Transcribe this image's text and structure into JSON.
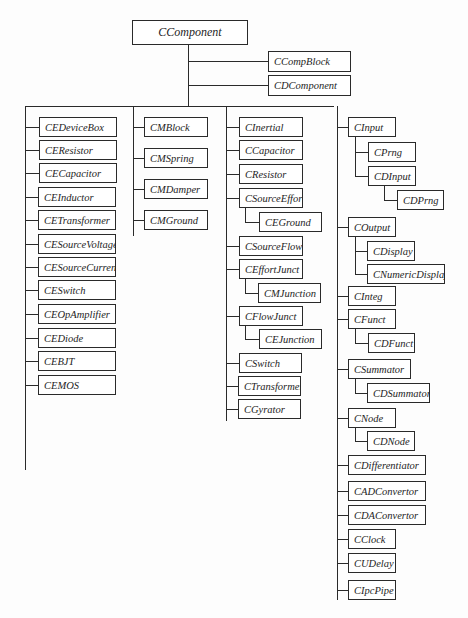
{
  "diagram": {
    "root": {
      "label": "CComponent",
      "x": 132,
      "y": 20,
      "w": 116,
      "h": 25
    },
    "boxes": [
      {
        "id": "ccompblock",
        "label": "CCompBlock",
        "x": 268,
        "y": 51,
        "w": 83,
        "h": 21
      },
      {
        "id": "cdcomponent",
        "label": "CDComponent",
        "x": 268,
        "y": 75,
        "w": 83,
        "h": 21
      },
      {
        "id": "cedevicebox",
        "label": "CEDeviceBox",
        "x": 39,
        "y": 117,
        "w": 78,
        "h": 20
      },
      {
        "id": "ceresistor",
        "label": "CEResistor",
        "x": 39,
        "y": 140,
        "w": 78,
        "h": 20
      },
      {
        "id": "cecapacitor",
        "label": "CECapacitor",
        "x": 39,
        "y": 163,
        "w": 78,
        "h": 20
      },
      {
        "id": "ceinductor",
        "label": "CEInductor",
        "x": 38,
        "y": 187,
        "w": 78,
        "h": 20
      },
      {
        "id": "cetransformer",
        "label": "CETransformer",
        "x": 38,
        "y": 210,
        "w": 78,
        "h": 20
      },
      {
        "id": "cesourcevoltage",
        "label": "CESourceVoltage",
        "x": 38,
        "y": 234,
        "w": 78,
        "h": 20
      },
      {
        "id": "cesourcecurrent",
        "label": "CESourceCurrent",
        "x": 38,
        "y": 257,
        "w": 78,
        "h": 20
      },
      {
        "id": "ceswitch",
        "label": "CESwitch",
        "x": 38,
        "y": 280,
        "w": 78,
        "h": 20
      },
      {
        "id": "ceopamplifier",
        "label": "CEOpAmplifier",
        "x": 38,
        "y": 304,
        "w": 78,
        "h": 20
      },
      {
        "id": "cediode",
        "label": "CEDiode",
        "x": 38,
        "y": 328,
        "w": 78,
        "h": 20
      },
      {
        "id": "cebjt",
        "label": "CEBJT",
        "x": 38,
        "y": 351,
        "w": 78,
        "h": 20
      },
      {
        "id": "cemos",
        "label": "CEMOS",
        "x": 38,
        "y": 375,
        "w": 78,
        "h": 20
      },
      {
        "id": "cmblock",
        "label": "CMBlock",
        "x": 144,
        "y": 117,
        "w": 64,
        "h": 20
      },
      {
        "id": "cmspring",
        "label": "CMSpring",
        "x": 144,
        "y": 148,
        "w": 64,
        "h": 20
      },
      {
        "id": "cmdamper",
        "label": "CMDamper",
        "x": 144,
        "y": 179,
        "w": 64,
        "h": 20
      },
      {
        "id": "cmground",
        "label": "CMGround",
        "x": 144,
        "y": 210,
        "w": 64,
        "h": 20
      },
      {
        "id": "cinertial",
        "label": "CInertial",
        "x": 239,
        "y": 117,
        "w": 64,
        "h": 20
      },
      {
        "id": "ccapacitor",
        "label": "CCapacitor",
        "x": 239,
        "y": 140,
        "w": 64,
        "h": 20
      },
      {
        "id": "cresistor",
        "label": "CResistor",
        "x": 239,
        "y": 164,
        "w": 64,
        "h": 20
      },
      {
        "id": "csourceeffort",
        "label": "CSourceEffort",
        "x": 239,
        "y": 188,
        "w": 64,
        "h": 20
      },
      {
        "id": "ceground",
        "label": "CEGround",
        "x": 259,
        "y": 212,
        "w": 63,
        "h": 20
      },
      {
        "id": "csourceflow",
        "label": "CSourceFlow",
        "x": 239,
        "y": 236,
        "w": 64,
        "h": 20
      },
      {
        "id": "ceffortjunct",
        "label": "CEffortJunct",
        "x": 239,
        "y": 259,
        "w": 64,
        "h": 20
      },
      {
        "id": "cmjunction",
        "label": "CMJunction",
        "x": 258,
        "y": 283,
        "w": 63,
        "h": 20
      },
      {
        "id": "cflowjunct",
        "label": "CFlowJunct",
        "x": 239,
        "y": 306,
        "w": 64,
        "h": 20
      },
      {
        "id": "cejunction",
        "label": "CEJunction",
        "x": 259,
        "y": 329,
        "w": 63,
        "h": 20
      },
      {
        "id": "cswitch",
        "label": "CSwitch",
        "x": 239,
        "y": 353,
        "w": 63,
        "h": 20
      },
      {
        "id": "ctransformer",
        "label": "CTransformer",
        "x": 238,
        "y": 376,
        "w": 63,
        "h": 20
      },
      {
        "id": "cgyrator",
        "label": "CGyrator",
        "x": 238,
        "y": 399,
        "w": 63,
        "h": 20
      },
      {
        "id": "cinput",
        "label": "CInput",
        "x": 348,
        "y": 117,
        "w": 48,
        "h": 20
      },
      {
        "id": "cprng",
        "label": "CPrng",
        "x": 368,
        "y": 142,
        "w": 48,
        "h": 20
      },
      {
        "id": "cdinput",
        "label": "CDInput",
        "x": 368,
        "y": 166,
        "w": 48,
        "h": 20
      },
      {
        "id": "cdprng",
        "label": "CDPrng",
        "x": 397,
        "y": 190,
        "w": 47,
        "h": 20
      },
      {
        "id": "coutput",
        "label": "COutput",
        "x": 348,
        "y": 217,
        "w": 48,
        "h": 20
      },
      {
        "id": "cdisplay",
        "label": "CDisplay",
        "x": 367,
        "y": 241,
        "w": 48,
        "h": 20
      },
      {
        "id": "cnumericdisplay",
        "label": "CNumericDisplay",
        "x": 367,
        "y": 264,
        "w": 78,
        "h": 20
      },
      {
        "id": "cinteg",
        "label": "CInteg",
        "x": 348,
        "y": 286,
        "w": 48,
        "h": 20
      },
      {
        "id": "cfunct",
        "label": "CFunct",
        "x": 348,
        "y": 309,
        "w": 48,
        "h": 20
      },
      {
        "id": "cdfunct",
        "label": "CDFunct",
        "x": 368,
        "y": 333,
        "w": 47,
        "h": 20
      },
      {
        "id": "csummator",
        "label": "CSummator",
        "x": 348,
        "y": 359,
        "w": 63,
        "h": 20
      },
      {
        "id": "cdsummator",
        "label": "CDSummator",
        "x": 367,
        "y": 383,
        "w": 63,
        "h": 20
      },
      {
        "id": "cnode",
        "label": "CNode",
        "x": 348,
        "y": 408,
        "w": 48,
        "h": 20
      },
      {
        "id": "cdnode",
        "label": "CDNode",
        "x": 367,
        "y": 431,
        "w": 48,
        "h": 20
      },
      {
        "id": "cdifferentiator",
        "label": "CDifferentiator",
        "x": 348,
        "y": 455,
        "w": 78,
        "h": 20
      },
      {
        "id": "cadconvertor",
        "label": "CADConvertor",
        "x": 348,
        "y": 481,
        "w": 78,
        "h": 20
      },
      {
        "id": "cdaconvertor",
        "label": "CDAConvertor",
        "x": 348,
        "y": 505,
        "w": 78,
        "h": 20
      },
      {
        "id": "cclock",
        "label": "CClock",
        "x": 348,
        "y": 529,
        "w": 48,
        "h": 20
      },
      {
        "id": "cudelay",
        "label": "CUDelay",
        "x": 348,
        "y": 553,
        "w": 48,
        "h": 20
      },
      {
        "id": "cipcpipe",
        "label": "CIpcPipe",
        "x": 348,
        "y": 580,
        "w": 48,
        "h": 20
      }
    ]
  }
}
